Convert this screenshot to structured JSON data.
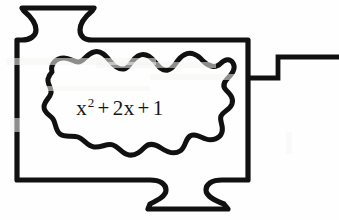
{
  "figure": {
    "caption_text": "x² + 2x + 1",
    "formula": {
      "base": "x",
      "exponent": "2",
      "operator_one": "+",
      "second_term": "2x",
      "operator_two": "+",
      "third_term": "1"
    },
    "colors": {
      "ink": "#111111",
      "background": "#fefefe"
    },
    "shapes": {
      "outer_container_name": "puzzle-piece-container",
      "inner_blob_name": "wavy-blob-region",
      "top_tab_name": "top-tab",
      "bottom_tab_name": "bottom-tab",
      "right_connector_name": "right-step-connector"
    }
  }
}
